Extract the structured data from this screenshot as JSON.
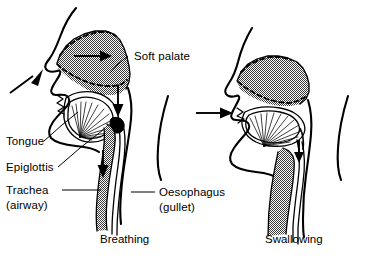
{
  "figure": {
    "background_color": "#ffffff",
    "ink_color": "#000000",
    "fill_pattern": "halftone-stipple-gray",
    "width": 376,
    "height": 260
  },
  "labels": {
    "soft_palate": "Soft palate",
    "tongue": "Tongue",
    "epiglottis": "Epiglottis",
    "trachea_line1": "Trachea",
    "trachea_line2": "(airway)",
    "oesophagus_line1": "Oesophagus",
    "oesophagus_line2": "(gullet)"
  },
  "captions": {
    "left": "Breathing",
    "right": "Swallowing"
  },
  "panels": [
    {
      "name": "breathing",
      "caption": "Breathing",
      "arrows": [
        {
          "name": "nostril-inflow-arrow",
          "direction": "up-right",
          "meaning": "air entering nostril"
        },
        {
          "name": "nasal-cavity-airflow-arrow",
          "direction": "right",
          "meaning": "air across nasal cavity"
        },
        {
          "name": "pharynx-down-arrow",
          "direction": "down",
          "meaning": "air down pharynx"
        },
        {
          "name": "trachea-down-arrow",
          "direction": "down",
          "meaning": "air down trachea"
        }
      ],
      "structures": [
        "nasal cavity",
        "soft palate",
        "tongue",
        "epiglottis",
        "trachea",
        "oesophagus"
      ]
    },
    {
      "name": "swallowing",
      "caption": "Swallowing",
      "arrows": [
        {
          "name": "mouth-inflow-arrow",
          "direction": "right",
          "meaning": "food entering mouth"
        },
        {
          "name": "oesophagus-down-arrow",
          "direction": "down",
          "meaning": "food down oesophagus"
        }
      ],
      "structures": [
        "raised soft palate",
        "tongue",
        "closed epiglottis",
        "oesophagus"
      ]
    }
  ]
}
